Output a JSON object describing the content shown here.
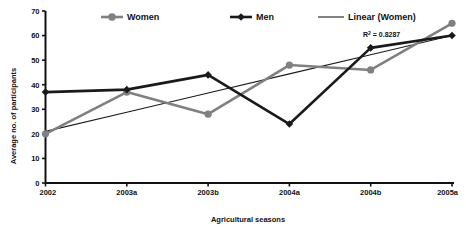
{
  "chart_data": {
    "type": "line",
    "title": "",
    "xlabel": "Agricultural seasons",
    "ylabel": "Average no. of participants",
    "categories": [
      "2002",
      "2003a",
      "2003b",
      "2004a",
      "2004b",
      "2005a"
    ],
    "ylim": [
      0,
      70
    ],
    "yticks": [
      0,
      10,
      20,
      30,
      40,
      50,
      60,
      70
    ],
    "ytick_labels": [
      "0",
      "10",
      "20",
      "30",
      "40",
      "50",
      "60",
      "70"
    ],
    "grid": false,
    "legend_position": "top",
    "series": [
      {
        "name": "Women",
        "values": [
          20,
          37,
          28,
          48,
          46,
          65
        ],
        "color": "#808080",
        "marker": "circle"
      },
      {
        "name": "Men",
        "values": [
          37,
          38,
          44,
          24,
          55,
          60
        ],
        "color": "#1a1a1a",
        "marker": "diamond"
      },
      {
        "name": "Linear (Women)",
        "values": [
          21,
          28.8,
          36.6,
          44.4,
          52.2,
          60
        ],
        "color": "#1a1a1a",
        "marker": "none",
        "trendline": true
      }
    ],
    "annotations": [
      {
        "text": "R² = 0.8287",
        "base": "R",
        "sup": "2",
        "rest": " = 0.8287",
        "x_category": "2004b",
        "y_value": 61.5
      }
    ]
  },
  "legend": {
    "items": [
      {
        "label": "Women",
        "color": "#808080",
        "marker": "circle"
      },
      {
        "label": "Men",
        "color": "#1a1a1a",
        "marker": "diamond"
      },
      {
        "label": "Linear (Women)",
        "color": "#1a1a1a",
        "marker": "none"
      }
    ]
  },
  "axes": {
    "y_title": "Average no. of participants",
    "x_title": "Agricultural seasons"
  }
}
